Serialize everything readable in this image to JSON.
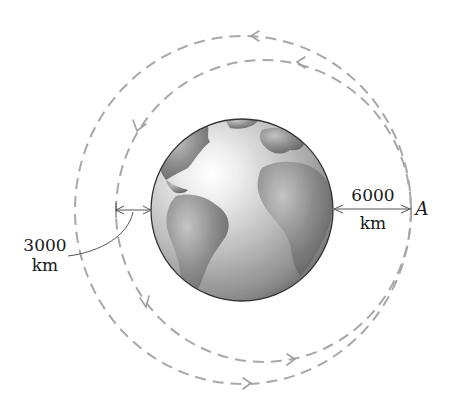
{
  "diagram": {
    "title": "",
    "labels": {
      "left_distance_value": "3000",
      "left_distance_unit": "km",
      "right_distance_value": "6000",
      "right_distance_unit": "km",
      "point": "A"
    },
    "colors": {
      "orbit": "#a8a8a8",
      "dimension_line": "#555555",
      "earth_ocean": "#c9c9c9",
      "earth_land": "#7d7d7d",
      "earth_outline": "#333333",
      "text": "#1a1a1a"
    },
    "orbits": [
      {
        "name": "outer-orbit",
        "direction": "counterclockwise"
      },
      {
        "name": "inner-orbit",
        "direction": "counterclockwise"
      }
    ]
  }
}
